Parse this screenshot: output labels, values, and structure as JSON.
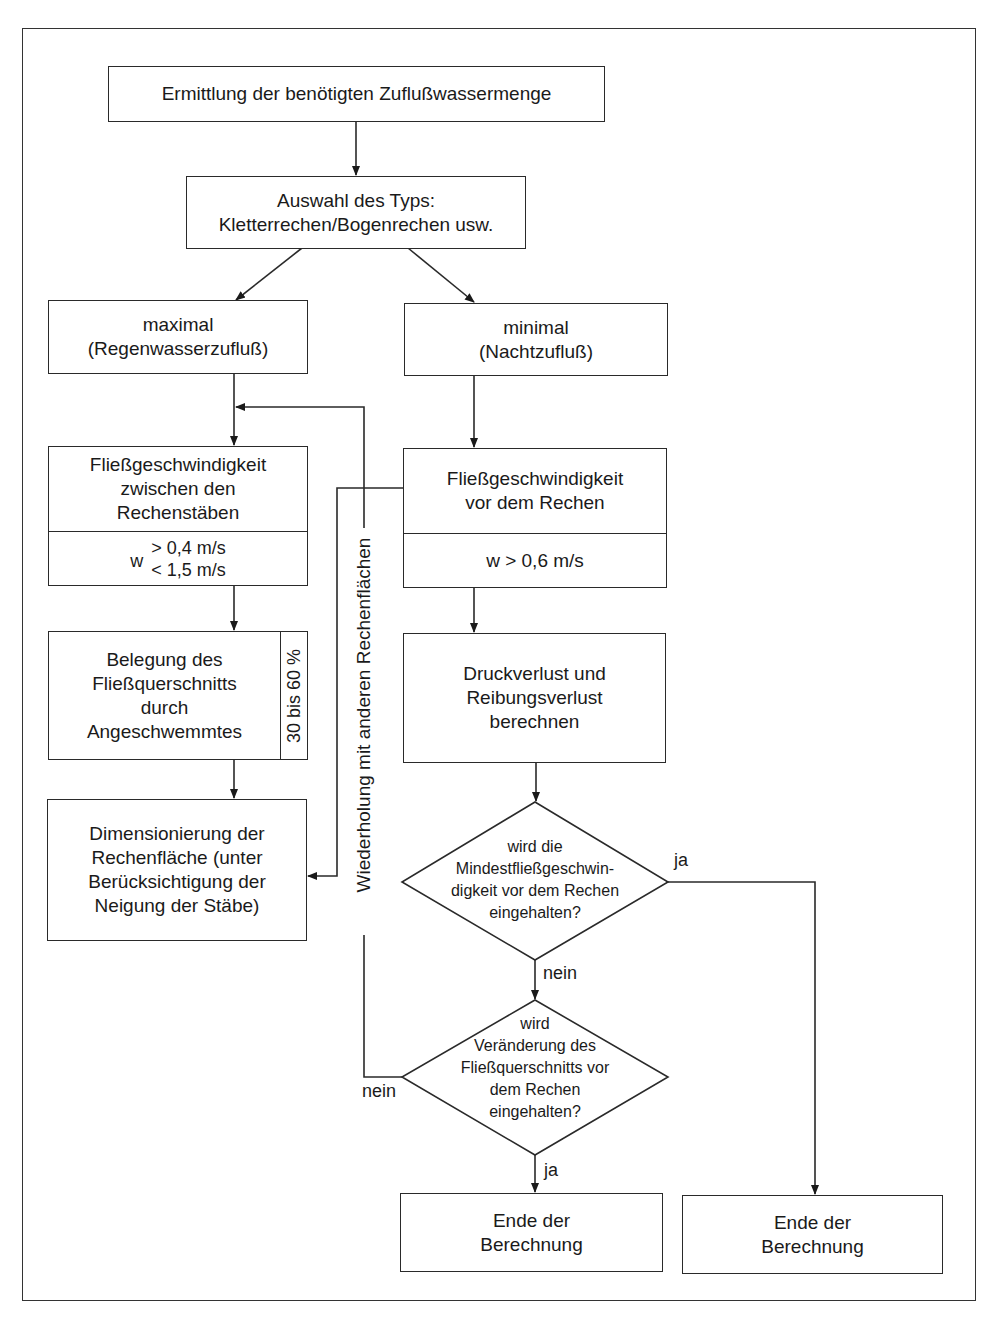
{
  "flowchart": {
    "start": {
      "label": "Ermittlung der benötigten Zuflußwassermenge"
    },
    "type_selection": {
      "label": "Auswahl des Typs:\nKletterrechen/Bogenrechen usw."
    },
    "left_branch": {
      "flow_max": {
        "label": "maximal\n(Regenwasserzufluß)"
      },
      "velocity": {
        "label": "Fließgeschwindigkeit\nzwischen den\nRechenstäben",
        "var": "w",
        "lower_limit": "> 0,4 m/s",
        "upper_limit": "< 1,5 m/s"
      },
      "blockage": {
        "label": "Belegung des\nFließquerschnitts\ndurch\nAngeschwemmtes",
        "side_value": "30 bis 60 %"
      },
      "dimensioning": {
        "label": "Dimensionierung der\nRechenfläche (unter\nBerücksichtigung der\nNeigung der Stäbe)"
      }
    },
    "right_branch": {
      "flow_min": {
        "label": "minimal\n(Nachtzufluß)"
      },
      "velocity": {
        "label": "Fließgeschwindigkeit\nvor dem Rechen",
        "condition": "w > 0,6 m/s"
      },
      "losses": {
        "label": "Druckverlust und\nReibungsverlust\nberechnen"
      },
      "decision1": {
        "label": "wird die\nMindestfließgeschwin-\ndigkeit vor dem Rechen\neingehalten?",
        "yes": "ja",
        "no": "nein"
      },
      "decision2": {
        "label": "wird\nVeränderung des\nFließquerschnitts vor\ndem Rechen\neingehalten?",
        "yes": "ja",
        "no": "nein"
      },
      "end_left": {
        "label": "Ende der\nBerechnung"
      },
      "end_right": {
        "label": "Ende der\nBerechnung"
      }
    },
    "loop_label": "Wiederholung mit anderen Rechenflächen"
  },
  "colors": {
    "line": "#2a2a2a",
    "background": "#ffffff",
    "text": "#1a1a1a"
  }
}
